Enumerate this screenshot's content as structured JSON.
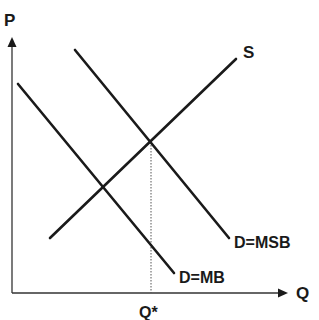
{
  "diagram": {
    "type": "supply-demand-externality",
    "axes": {
      "y_label": "P",
      "x_label": "Q"
    },
    "curves": [
      {
        "id": "supply",
        "label": "S",
        "x1": 50,
        "y1": 238,
        "x2": 236,
        "y2": 59
      },
      {
        "id": "demand-msb",
        "label": "D=MSB",
        "x1": 75,
        "y1": 50,
        "x2": 229,
        "y2": 238
      },
      {
        "id": "demand-mb",
        "label": "D=MB",
        "x1": 18,
        "y1": 84,
        "x2": 174,
        "y2": 273
      }
    ],
    "equilibrium": {
      "label": "Q*",
      "x": 151,
      "y": 142
    },
    "colors": {
      "line": "#1a1a1a",
      "axis": "#333333",
      "dotted": "#555555",
      "background": "#ffffff"
    }
  }
}
